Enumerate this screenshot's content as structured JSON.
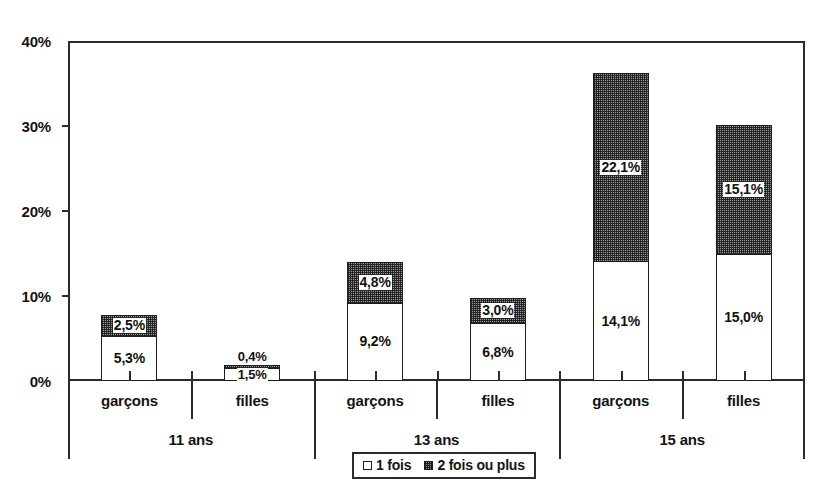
{
  "chart_data": {
    "type": "bar",
    "subtype": "stacked",
    "title": "",
    "xlabel": "",
    "ylabel": "",
    "ylim": [
      0,
      40
    ],
    "y_unit": "%",
    "grid": false,
    "legend_position": "bottom",
    "y_ticks": [
      "0%",
      "10%",
      "20%",
      "30%",
      "40%"
    ],
    "y_tick_values": [
      0,
      10,
      20,
      30,
      40
    ],
    "categories": [
      "garçons",
      "filles",
      "garçons",
      "filles",
      "garçons",
      "filles"
    ],
    "group_labels": [
      "11 ans",
      "13 ans",
      "15 ans"
    ],
    "series": [
      {
        "name": "1 fois",
        "values": [
          5.3,
          1.5,
          9.2,
          6.8,
          14.1,
          15.0
        ],
        "labels": [
          "5,3%",
          "1,5%",
          "9,2%",
          "6,8%",
          "14,1%",
          "15,0%"
        ]
      },
      {
        "name": "2 fois ou plus",
        "values": [
          2.5,
          0.4,
          4.8,
          3.0,
          22.1,
          15.1
        ],
        "labels": [
          "2,5%",
          "0,4%",
          "4,8%",
          "3,0%",
          "22,1%",
          "15,1%"
        ]
      }
    ],
    "totals": [
      7.8,
      1.9,
      14.0,
      9.8,
      36.2,
      30.1
    ]
  },
  "axis": {
    "y_ticks": [
      {
        "label": "40%",
        "value": 40
      },
      {
        "label": "30%",
        "value": 30
      },
      {
        "label": "20%",
        "value": 20
      },
      {
        "label": "10%",
        "value": 10
      },
      {
        "label": "0%",
        "value": 0
      }
    ],
    "groups": [
      {
        "label": "11 ans",
        "genders": [
          "garçons",
          "filles"
        ]
      },
      {
        "label": "13 ans",
        "genders": [
          "garçons",
          "filles"
        ]
      },
      {
        "label": "15 ans",
        "genders": [
          "garçons",
          "filles"
        ]
      }
    ]
  },
  "bars": [
    {
      "gender": "garçons",
      "group": "11 ans",
      "s1": 5.3,
      "s1_label": "5,3%",
      "s2": 2.5,
      "s2_label": "2,5%",
      "s2_label_outside": false
    },
    {
      "gender": "filles",
      "group": "11 ans",
      "s1": 1.5,
      "s1_label": "1,5%",
      "s2": 0.4,
      "s2_label": "0,4%",
      "s2_label_outside": true
    },
    {
      "gender": "garçons",
      "group": "13 ans",
      "s1": 9.2,
      "s1_label": "9,2%",
      "s2": 4.8,
      "s2_label": "4,8%",
      "s2_label_outside": false
    },
    {
      "gender": "filles",
      "group": "13 ans",
      "s1": 6.8,
      "s1_label": "6,8%",
      "s2": 3.0,
      "s2_label": "3,0%",
      "s2_label_outside": false
    },
    {
      "gender": "garçons",
      "group": "15 ans",
      "s1": 14.1,
      "s1_label": "14,1%",
      "s2": 22.1,
      "s2_label": "22,1%",
      "s2_label_outside": false
    },
    {
      "gender": "filles",
      "group": "15 ans",
      "s1": 15.0,
      "s1_label": "15,0%",
      "s2": 15.1,
      "s2_label": "15,1%",
      "s2_label_outside": false
    }
  ],
  "legend": {
    "items": [
      {
        "label": "1 fois",
        "swatch": "white-square"
      },
      {
        "label": "2 fois ou plus",
        "swatch": "hatched-square"
      }
    ]
  },
  "colors": {
    "series_1_fill": "#ffffff",
    "series_2_fill": "#9a9a9a",
    "outline": "#1e1e1e",
    "axis": "#2b2b2b",
    "text": "#141414",
    "background": "#ffffff"
  }
}
